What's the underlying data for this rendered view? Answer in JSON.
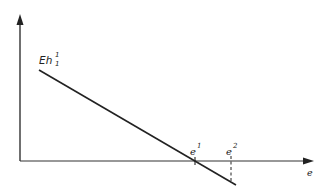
{
  "diagram": {
    "y_label": {
      "base": "Eh",
      "sup": "1",
      "sub": "1"
    },
    "x_axis_label": "e",
    "points": [
      {
        "base": "e",
        "sup": "1"
      },
      {
        "base": "e",
        "sup": "2"
      }
    ],
    "colors": {
      "line": "#222222",
      "background": "#ffffff"
    }
  }
}
